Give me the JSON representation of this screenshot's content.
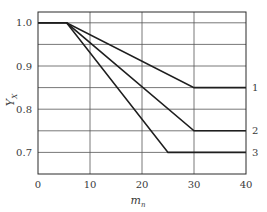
{
  "chart_data": {
    "type": "line",
    "title": "",
    "xlabel": "m_n",
    "ylabel": "Y_X",
    "xlim": [
      0,
      40
    ],
    "ylim": [
      0.65,
      1.025
    ],
    "x_ticks": [
      "0",
      "10",
      "20",
      "30",
      "40"
    ],
    "y_ticks": [
      "1.0",
      "0.9",
      "0.8",
      "0.7"
    ],
    "grid": true,
    "legend_position": "right, inline labels at line ends",
    "series": [
      {
        "name": "1",
        "x": [
          0,
          5.5,
          30,
          40
        ],
        "y": [
          1.0,
          1.0,
          0.85,
          0.85
        ]
      },
      {
        "name": "2",
        "x": [
          0,
          5.5,
          30,
          40
        ],
        "y": [
          1.0,
          1.0,
          0.75,
          0.75
        ]
      },
      {
        "name": "3",
        "x": [
          0,
          5.5,
          25,
          40
        ],
        "y": [
          1.0,
          1.0,
          0.7,
          0.7
        ]
      }
    ]
  },
  "labels": {
    "xlabel_main": "m",
    "xlabel_sub": "n",
    "ylabel_main": "Y",
    "ylabel_sub": "X"
  }
}
